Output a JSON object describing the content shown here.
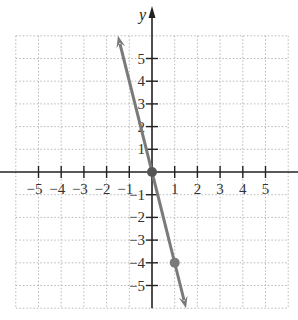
{
  "chart_data": {
    "type": "line",
    "title": "",
    "xlabel": "",
    "ylabel": "y",
    "xlim": [
      -6,
      6
    ],
    "ylim": [
      -6,
      6
    ],
    "grid": true,
    "grid_style": "dotted",
    "x_ticks": [
      -5,
      -4,
      -3,
      -2,
      -1,
      1,
      2,
      3,
      4,
      5
    ],
    "y_ticks": [
      5,
      4,
      3,
      2,
      1,
      -1,
      -2,
      -3,
      -4,
      -5
    ],
    "x_tick_labels": [
      "−5",
      "−4",
      "−3",
      "−2",
      "−1",
      "1",
      "2",
      "3",
      "4",
      "5"
    ],
    "y_tick_labels": [
      "5",
      "4",
      "3",
      "2",
      "1",
      "−1",
      "−2",
      "−3",
      "−4",
      "−5"
    ],
    "series": [
      {
        "name": "y = -4x",
        "slope": -4,
        "intercept": 0,
        "x": [
          -1.5,
          1.5
        ],
        "y": [
          6,
          -6
        ],
        "arrows": "both",
        "color": "#7a7a7a"
      }
    ],
    "points": [
      {
        "x": 0,
        "y": 0,
        "color": "#555555"
      },
      {
        "x": 1,
        "y": -4,
        "color": "#7a7a7a"
      }
    ],
    "legend": null
  },
  "colors": {
    "axis": "#222222",
    "grid": "#b8b8b8",
    "line": "#7a7a7a"
  }
}
